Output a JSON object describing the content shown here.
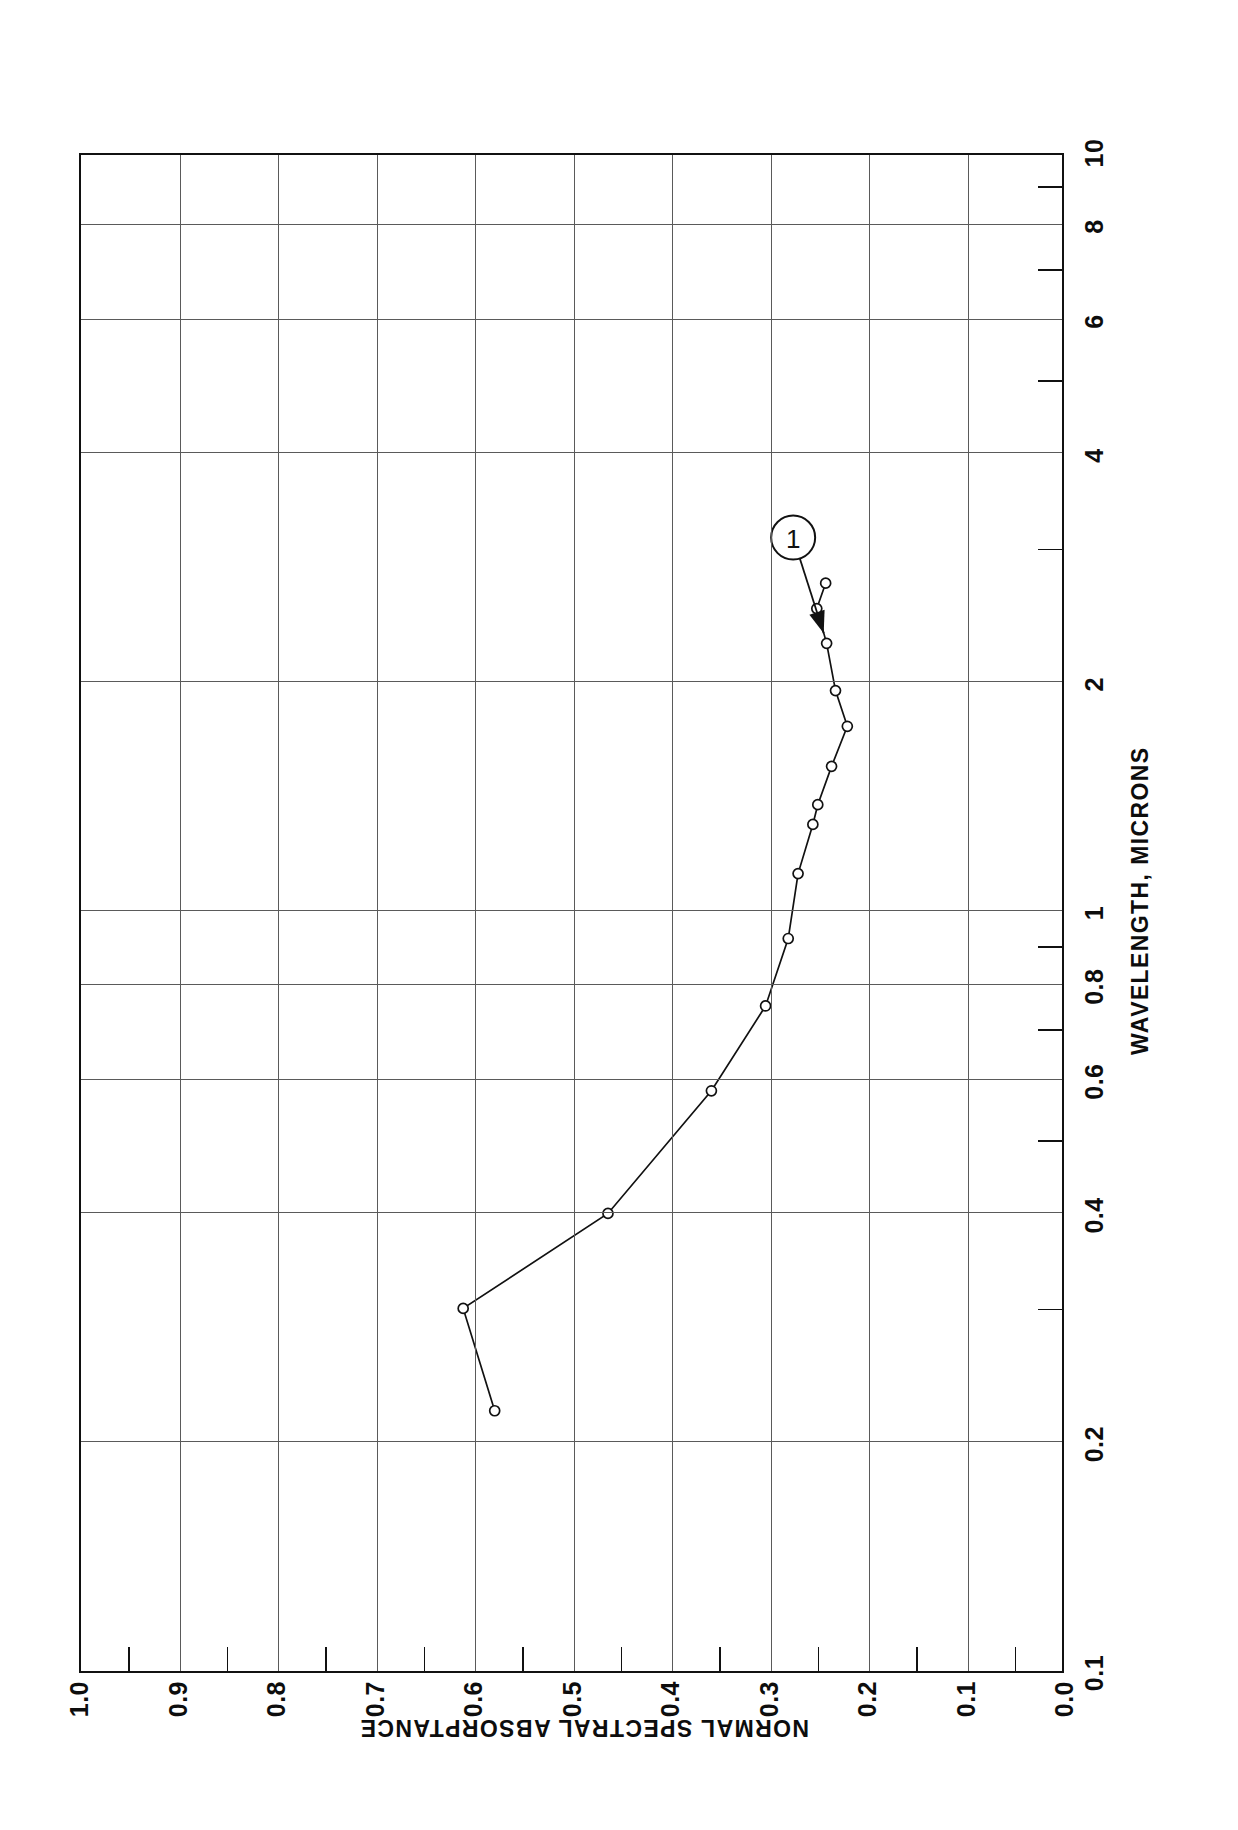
{
  "figure": {
    "number_label": "FIGURE  155",
    "title_lines": [
      "NORMAL",
      "SPECTRAL",
      "ABSORPTANCE OF",
      "PALLADIUM"
    ]
  },
  "axes": {
    "x_title": "WAVELENGTH, MICRONS",
    "y_title": "NORMAL SPECTRAL ABSORPTANCE",
    "x_tick_labels": [
      "0.1",
      "0.2",
      "0.4",
      "0.6",
      "0.8",
      "1",
      "2",
      "4",
      "6",
      "8",
      "10"
    ],
    "y_tick_labels": [
      "0.0",
      "0.1",
      "0.2",
      "0.3",
      "0.4",
      "0.5",
      "0.6",
      "0.7",
      "0.8",
      "0.9",
      "1.0"
    ]
  },
  "annotation": {
    "marker_label": "1"
  },
  "chart_data": {
    "type": "line",
    "title": "NORMAL SPECTRAL ABSORPTANCE OF PALLADIUM",
    "subtitle": "FIGURE  155",
    "xlabel": "WAVELENGTH, MICRONS",
    "ylabel": "NORMAL SPECTRAL ABSORPTANCE",
    "xscale": "log",
    "yscale": "linear",
    "xlim": [
      0.1,
      10
    ],
    "ylim": [
      0.0,
      1.0
    ],
    "grid": true,
    "legend": null,
    "xticks": [
      0.1,
      0.2,
      0.4,
      0.6,
      0.8,
      1,
      2,
      4,
      6,
      8,
      10
    ],
    "yticks": [
      0.0,
      0.1,
      0.2,
      0.3,
      0.4,
      0.5,
      0.6,
      0.7,
      0.8,
      0.9,
      1.0
    ],
    "series": [
      {
        "name": "1",
        "marker": "open-circle",
        "x": [
          0.22,
          0.3,
          0.4,
          0.58,
          0.75,
          0.92,
          1.12,
          1.3,
          1.38,
          1.55,
          1.75,
          1.95,
          2.25,
          2.5,
          2.7
        ],
        "y": [
          0.58,
          0.612,
          0.465,
          0.36,
          0.305,
          0.282,
          0.272,
          0.257,
          0.252,
          0.238,
          0.222,
          0.234,
          0.243,
          0.253,
          0.244
        ]
      }
    ],
    "annotations": [
      {
        "text": "1",
        "shape": "circled-number",
        "x": 3.1,
        "y": 0.277,
        "points_to": {
          "x": 2.32,
          "y": 0.246
        }
      }
    ]
  }
}
